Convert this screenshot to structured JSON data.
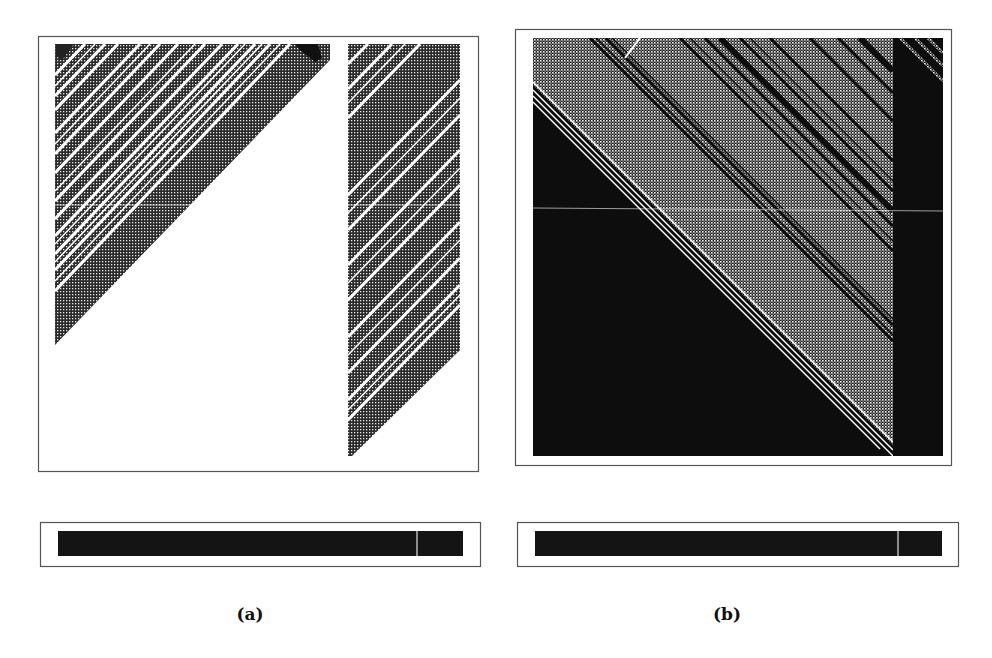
{
  "figure": {
    "type": "cellular-automaton space-time diagrams",
    "panels": [
      {
        "id": "a",
        "caption": "(a)",
        "main_plot": {
          "background": "#ffffff",
          "texture": "checkerboard dither (gray) with white diagonal stripes",
          "structure": [
            "left triangular band descending toward lower-left",
            "right vertical strip with diagonal stripes"
          ]
        },
        "bar": {
          "fill": "#111111",
          "divider_position_fraction": 0.89
        }
      },
      {
        "id": "b",
        "caption": "(b)",
        "main_plot": {
          "background": "#0d0d0d",
          "texture": "checkerboard dither (light gray) band descending toward lower-right, black right column",
          "structure": [
            "black lower-left triangle",
            "gray diagonal band with black/white stripes",
            "black right column"
          ]
        },
        "bar": {
          "fill": "#111111",
          "divider_position_fraction": 0.89
        }
      }
    ]
  },
  "colors": {
    "ink": "#111111",
    "paper": "#ffffff",
    "frame": "#555555"
  }
}
